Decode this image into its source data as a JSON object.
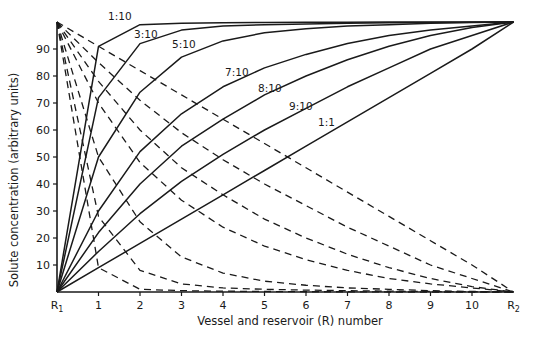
{
  "chart_data": {
    "type": "line",
    "title": "",
    "xlabel": "Vessel and reservoir (R) number",
    "ylabel": "Solute concentration (arbitrary units)",
    "x_ticks": [
      "R1",
      "1",
      "2",
      "3",
      "4",
      "5",
      "6",
      "7",
      "8",
      "9",
      "10",
      "R2"
    ],
    "x": [
      0,
      1,
      2,
      3,
      4,
      5,
      6,
      7,
      8,
      9,
      10,
      11
    ],
    "y_ticks": [
      10,
      20,
      30,
      40,
      50,
      60,
      70,
      80,
      90
    ],
    "ylim": [
      0,
      100
    ],
    "grid": false,
    "legend": "inline labels on solid curves",
    "series": [
      {
        "name": "1:10",
        "style": "solid",
        "values": [
          0,
          91,
          99,
          99.5,
          99.7,
          99.8,
          99.9,
          99.9,
          100,
          100,
          100,
          100
        ]
      },
      {
        "name": "3:10",
        "style": "solid",
        "values": [
          0,
          72,
          92,
          97,
          98.5,
          99,
          99.3,
          99.5,
          99.7,
          99.8,
          99.9,
          100
        ]
      },
      {
        "name": "5:10",
        "style": "solid",
        "values": [
          0,
          50,
          74,
          87,
          93,
          96,
          97.5,
          98.5,
          99,
          99.5,
          99.8,
          100
        ]
      },
      {
        "name": "7:10",
        "style": "solid",
        "values": [
          0,
          30,
          52,
          66,
          76,
          83,
          88,
          92,
          95,
          97,
          98.5,
          100
        ]
      },
      {
        "name": "8:10",
        "style": "solid",
        "values": [
          0,
          22,
          40,
          54,
          64,
          73,
          80,
          86,
          91,
          95,
          98,
          100
        ]
      },
      {
        "name": "9:10",
        "style": "solid",
        "values": [
          0,
          15,
          29,
          41,
          51,
          60,
          68,
          76,
          83,
          90,
          95,
          100
        ]
      },
      {
        "name": "1:1",
        "style": "solid",
        "values": [
          0,
          9,
          18,
          27,
          36,
          45,
          54,
          63,
          72,
          81,
          90,
          100
        ]
      },
      {
        "name": "1:10 (R1 solute)",
        "style": "dashed",
        "values": [
          100,
          9,
          1,
          0.5,
          0.3,
          0.2,
          0.1,
          0.1,
          0,
          0,
          0,
          0
        ]
      },
      {
        "name": "3:10 (R1 solute)",
        "style": "dashed",
        "values": [
          100,
          28,
          8,
          3,
          1.5,
          1,
          0.7,
          0.5,
          0.3,
          0.2,
          0.1,
          0
        ]
      },
      {
        "name": "5:10 (R1 solute)",
        "style": "dashed",
        "values": [
          100,
          50,
          26,
          13,
          7,
          4,
          2.5,
          1.5,
          1,
          0.5,
          0.2,
          0
        ]
      },
      {
        "name": "7:10 (R1 solute)",
        "style": "dashed",
        "values": [
          100,
          70,
          48,
          34,
          24,
          17,
          12,
          8,
          5,
          3,
          1.5,
          0
        ]
      },
      {
        "name": "8:10 (R1 solute)",
        "style": "dashed",
        "values": [
          100,
          78,
          60,
          46,
          36,
          27,
          20,
          14,
          9,
          5,
          2,
          0
        ]
      },
      {
        "name": "9:10 (R1 solute)",
        "style": "dashed",
        "values": [
          100,
          85,
          71,
          59,
          49,
          40,
          32,
          24,
          17,
          10,
          5,
          0
        ]
      },
      {
        "name": "1:1 (R1 solute)",
        "style": "dashed",
        "values": [
          100,
          91,
          82,
          73,
          64,
          55,
          46,
          37,
          28,
          19,
          10,
          0
        ]
      }
    ],
    "annotations": [
      "1:10",
      "3:10",
      "5:10",
      "7:10",
      "8:10",
      "9:10",
      "1:1"
    ]
  },
  "axis": {
    "xlabel": "Vessel and reservoir (R) number",
    "ylabel": "Solute concentration (arbitrary units)"
  }
}
